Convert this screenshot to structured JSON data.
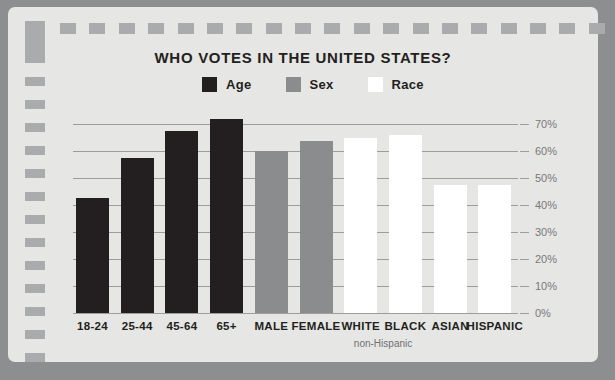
{
  "chart_data": {
    "type": "bar",
    "title": "WHO VOTES IN THE UNITED STATES?",
    "xlabel": "",
    "ylabel": "",
    "ylim": [
      0,
      70
    ],
    "grid": true,
    "legend_position": "top-center",
    "y_ticks": [
      "0%",
      "10%",
      "20%",
      "30%",
      "40%",
      "50%",
      "60%",
      "70%"
    ],
    "y_tick_values": [
      0,
      10,
      20,
      30,
      40,
      50,
      60,
      70
    ],
    "legend": [
      {
        "name": "Age",
        "color": "#231f20"
      },
      {
        "name": "Sex",
        "color": "#8a8c8e"
      },
      {
        "name": "Race",
        "color": "#ffffff"
      }
    ],
    "categories": [
      "18-24",
      "25-44",
      "45-64",
      "65+",
      "MALE",
      "FEMALE",
      "WHITE",
      "BLACK",
      "ASIAN",
      "HISPANIC"
    ],
    "values": [
      42.6,
      57.4,
      67.4,
      71.9,
      60.0,
      63.7,
      64.8,
      65.9,
      47.4,
      47.4
    ],
    "groups": [
      "Age",
      "Age",
      "Age",
      "Age",
      "Sex",
      "Sex",
      "Race",
      "Race",
      "Race",
      "Race"
    ],
    "bar_colors": [
      "#231f20",
      "#231f20",
      "#231f20",
      "#231f20",
      "#8a8c8e",
      "#8a8c8e",
      "#ffffff",
      "#ffffff",
      "#ffffff",
      "#ffffff"
    ],
    "annotations": [
      {
        "text": "non-Hispanic",
        "under_categories": [
          "WHITE",
          "BLACK"
        ]
      }
    ]
  },
  "theme": {
    "page_background": "#8c8e90",
    "card_background": "#e6e6e4",
    "accent_gray": "#a9abad",
    "grid_color": "#9b9d9f",
    "text_dark": "#231f20",
    "text_muted": "#77797b"
  },
  "decor": {
    "top_marks": 19,
    "left_marks": 13
  }
}
